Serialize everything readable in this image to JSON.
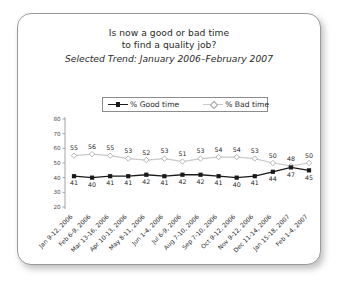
{
  "card": {
    "title_line_1": "Is now a good or bad time",
    "title_line_2": "to find a quality job?",
    "subtitle": "Selected Trend: January 2006–February 2007"
  },
  "legend": {
    "good_label": "% Good time",
    "bad_label": "% Bad time",
    "good_marker": "filled-square-marker",
    "bad_marker": "open-diamond-marker"
  },
  "colors": {
    "good_line": "#1a1a1a",
    "bad_line": "#c9c9c9",
    "axis": "#9a9a9a",
    "border": "#9a9a9a",
    "text": "#2b2b2b"
  },
  "chart_data": {
    "type": "line",
    "title": "Is now a good or bad time to find a quality job?",
    "subtitle": "Selected Trend: January 2006–February 2007",
    "xlabel": "",
    "ylabel": "",
    "ylim": [
      20,
      80
    ],
    "yticks": [
      20,
      30,
      40,
      50,
      60,
      70,
      80
    ],
    "grid": false,
    "legend_position": "top",
    "categories": [
      "Jan 9-12, 2006",
      "Feb 6-9, 2006",
      "Mar 13-16, 2006",
      "Apr 10-13, 2006",
      "May 8-11, 2006",
      "Jun 1-4, 2006",
      "Jul 6-9, 2006",
      "Aug 7-10, 2006",
      "Sep 7-10, 2006",
      "Oct 9-12, 2006",
      "Nov 9-12, 2006",
      "Dec 11-14, 2006",
      "Jan 15-18, 2007",
      "Feb 1-4, 2007"
    ],
    "series": [
      {
        "name": "% Bad time",
        "values": [
          55,
          56,
          55,
          53,
          52,
          53,
          51,
          53,
          54,
          54,
          53,
          50,
          48,
          50
        ]
      },
      {
        "name": "% Good time",
        "values": [
          41,
          40,
          41,
          41,
          42,
          41,
          42,
          42,
          41,
          40,
          41,
          44,
          47,
          45
        ]
      }
    ]
  }
}
